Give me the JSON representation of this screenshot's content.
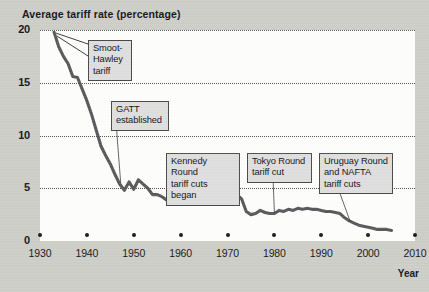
{
  "chart_data": {
    "type": "line",
    "title": "Average tariff rate (percentage)",
    "xlabel": "Year",
    "ylabel": "Average tariff rate (percentage)",
    "xlim": [
      1930,
      2010
    ],
    "ylim": [
      0,
      20
    ],
    "grid": true,
    "legend": "none",
    "y_ticks": [
      "20",
      "15",
      "10",
      "5",
      "0"
    ],
    "y_tick_values": [
      20,
      15,
      10,
      5,
      0
    ],
    "x_ticks": [
      "1930",
      "1940",
      "1950",
      "1960",
      "1970",
      "1980",
      "1990",
      "2000",
      "2010"
    ],
    "x_tick_values": [
      1930,
      1940,
      1950,
      1960,
      1970,
      1980,
      1990,
      2000,
      2010
    ],
    "series": [
      {
        "name": "Average tariff rate",
        "color": "#59595b",
        "x": [
          1933,
          1934,
          1935,
          1936,
          1937,
          1938,
          1939,
          1940,
          1941,
          1942,
          1943,
          1944,
          1945,
          1946,
          1947,
          1948,
          1949,
          1950,
          1951,
          1952,
          1953,
          1954,
          1955,
          1956,
          1957,
          1958,
          1959,
          1960,
          1961,
          1962,
          1963,
          1964,
          1965,
          1966,
          1967,
          1968,
          1969,
          1970,
          1971,
          1972,
          1973,
          1974,
          1975,
          1976,
          1977,
          1978,
          1979,
          1980,
          1981,
          1982,
          1983,
          1984,
          1985,
          1986,
          1987,
          1988,
          1989,
          1990,
          1991,
          1992,
          1993,
          1994,
          1995,
          1996,
          1997,
          1998,
          1999,
          2000,
          2001,
          2002,
          2003,
          2004,
          2005
        ],
        "values": [
          19.8,
          18.4,
          17.5,
          16.8,
          15.6,
          15.5,
          14.4,
          13.3,
          12.0,
          10.5,
          9.0,
          8.1,
          7.3,
          6.3,
          5.4,
          4.8,
          5.6,
          4.9,
          5.8,
          5.4,
          5.0,
          4.4,
          4.4,
          4.2,
          3.9,
          4.1,
          3.7,
          3.5,
          3.6,
          3.9,
          4.0,
          4.2,
          4.9,
          4.4,
          4.5,
          4.5,
          4.4,
          4.5,
          4.4,
          4.4,
          4.0,
          2.8,
          2.5,
          2.6,
          2.9,
          2.7,
          2.6,
          2.6,
          2.9,
          2.8,
          3.0,
          2.9,
          3.1,
          3.0,
          3.1,
          3.0,
          3.0,
          2.9,
          2.8,
          2.8,
          2.7,
          2.6,
          2.2,
          1.9,
          1.7,
          1.5,
          1.4,
          1.3,
          1.2,
          1.1,
          1.1,
          1.1,
          1.0
        ]
      }
    ],
    "annotations": [
      {
        "id": "smoot-hawley",
        "label": "Smoot-\nHawley\ntariff",
        "lines": [
          "Smoot-",
          "Hawley",
          "tariff"
        ],
        "points_to_year": 1933,
        "points_to_value": 19.8
      },
      {
        "id": "gatt-established",
        "label": "GATT\nestablished",
        "lines": [
          "GATT",
          "established"
        ],
        "points_to_year": 1947,
        "points_to_value": 5.4
      },
      {
        "id": "kennedy-round",
        "label": "Kennedy Round\ntariff cuts began",
        "lines": [
          "Kennedy Round",
          "tariff cuts began"
        ],
        "points_to_year": 1968,
        "points_to_value": 4.5
      },
      {
        "id": "tokyo-round",
        "label": "Tokyo Round\ntariff cut",
        "lines": [
          "Tokyo Round",
          "tariff cut"
        ],
        "points_to_year": 1980,
        "points_to_value": 2.6
      },
      {
        "id": "uruguay-nafta",
        "label": "Uruguay Round\nand NAFTA\ntariff cuts",
        "lines": [
          "Uruguay Round",
          "and NAFTA",
          "tariff cuts"
        ],
        "points_to_year": 1996,
        "points_to_value": 1.9
      }
    ]
  },
  "figure": {
    "title": "Average tariff rate (percentage)",
    "xaxis_title": "Year",
    "background_color": "#cecec8",
    "plot_background_color": "#fdfdfc",
    "line_color": "#59595b",
    "callout_fill": "#dedede",
    "callout_border": "#4a4a4a"
  },
  "callouts": {
    "smoot_hawley": {
      "line1": "Smoot-",
      "line2": "Hawley",
      "line3": "tariff"
    },
    "gatt": {
      "line1": "GATT",
      "line2": "established"
    },
    "kennedy": {
      "line1": "Kennedy Round",
      "line2": "tariff cuts began"
    },
    "tokyo": {
      "line1": "Tokyo Round",
      "line2": "tariff cut"
    },
    "uruguay": {
      "line1": "Uruguay Round",
      "line2": "and NAFTA",
      "line3": "tariff cuts"
    }
  }
}
